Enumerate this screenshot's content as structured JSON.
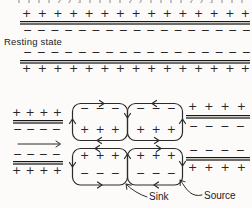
{
  "colors": {
    "ink": "#2b2b2b",
    "membrane_dark": "#181818",
    "membrane_gray": "#6d6d6d",
    "background": "#fcfbf9"
  },
  "resting_section": {
    "label": "Resting state",
    "rows": {
      "top_outside": {
        "symbol": "+",
        "count": 15
      },
      "top_inside": {
        "symbol": "−",
        "count": 17
      },
      "bottom_inside": {
        "symbol": "−",
        "count": 17
      },
      "bottom_outside": {
        "symbol": "+",
        "count": 15
      }
    }
  },
  "propagation_section": {
    "direction_arrow": "right",
    "segments": {
      "left_top": {
        "outside": {
          "symbol": "+",
          "count": 4
        },
        "inside": {
          "symbol": "−",
          "count": 4
        }
      },
      "left_bottom": {
        "inside": {
          "symbol": "−",
          "count": 4
        },
        "outside": {
          "symbol": "+",
          "count": 4
        }
      },
      "right_top": {
        "outside": {
          "symbol": "+",
          "count": 4
        },
        "inside": {
          "symbol": "−",
          "count": 4
        }
      },
      "right_bottom": {
        "inside": {
          "symbol": "−",
          "count": 4
        },
        "outside": {
          "symbol": "+",
          "count": 4
        }
      }
    },
    "loops": {
      "upper_left": {
        "top": {
          "symbol": "−",
          "count": 3
        },
        "bottom": {
          "symbol": "+",
          "count": 3
        },
        "circulation": "clockwise"
      },
      "upper_right": {
        "top": {
          "symbol": "−",
          "count": 3
        },
        "bottom": {
          "symbol": "+",
          "count": 3
        },
        "circulation": "counterclockwise"
      },
      "lower_left": {
        "top": {
          "symbol": "+",
          "count": 3
        },
        "bottom": {
          "symbol": "−",
          "count": 3
        },
        "circulation": "counterclockwise"
      },
      "lower_right": {
        "top": {
          "symbol": "+",
          "count": 3
        },
        "bottom": {
          "symbol": "−",
          "count": 3
        },
        "circulation": "clockwise"
      }
    },
    "labels": {
      "sink": "Sink",
      "source": "Source"
    }
  }
}
